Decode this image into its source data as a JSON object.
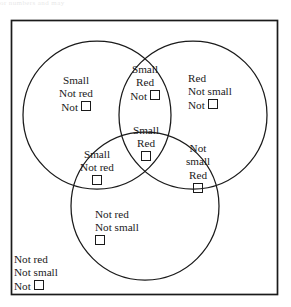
{
  "figure": {
    "type": "three-set Venn diagram",
    "top_sliver_text": "or numbers and may",
    "square_glyph": "open-square",
    "line_color": "#1a1a1a",
    "background_color": "#ffffff",
    "box": {
      "x": 11,
      "y": 20,
      "width": 267,
      "height": 275
    },
    "circles": [
      {
        "name": "small-circle",
        "label": "Small",
        "cx": 97,
        "cy": 115,
        "r": 74
      },
      {
        "name": "red-circle",
        "label": "Red",
        "cx": 193,
        "cy": 115,
        "r": 74
      },
      {
        "name": "square-circle",
        "label": "Square",
        "cx": 145,
        "cy": 206,
        "r": 74
      }
    ]
  },
  "regions": [
    {
      "id": "small-only",
      "name": "region-small-not-red-not-square",
      "sets": [
        "Small"
      ],
      "lines": [
        "Small",
        "Not red",
        "Not"
      ],
      "has_square": true,
      "square_on_line": 3
    },
    {
      "id": "small-red",
      "name": "region-small-red-not-square",
      "sets": [
        "Small",
        "Red"
      ],
      "lines": [
        "Small",
        "Red",
        "Not"
      ],
      "has_square": true,
      "square_on_line": 3
    },
    {
      "id": "red-only",
      "name": "region-red-not-small-not-square",
      "sets": [
        "Red"
      ],
      "lines": [
        "Red",
        "Not small",
        "Not"
      ],
      "has_square": true,
      "square_on_line": 3
    },
    {
      "id": "small-red-square",
      "name": "region-small-red-square",
      "sets": [
        "Small",
        "Red",
        "Square"
      ],
      "lines": [
        "Small",
        "Red",
        ""
      ],
      "has_square": true,
      "square_on_line": 3
    },
    {
      "id": "small-square",
      "name": "region-small-not-red-square",
      "sets": [
        "Small",
        "Square"
      ],
      "lines": [
        "Small",
        "Not red",
        ""
      ],
      "has_square": true,
      "square_on_line": 3
    },
    {
      "id": "red-square",
      "name": "region-not-small-red-square",
      "sets": [
        "Red",
        "Square"
      ],
      "lines": [
        "Not",
        "small",
        "Red",
        ""
      ],
      "has_square": true,
      "square_on_line": 4
    },
    {
      "id": "square-only",
      "name": "region-not-red-not-small-square",
      "sets": [
        "Square"
      ],
      "lines": [
        "Not red",
        "Not small",
        ""
      ],
      "has_square": true,
      "square_on_line": 3
    },
    {
      "id": "none",
      "name": "region-not-red-not-small-not-square",
      "sets": [],
      "lines": [
        "Not red",
        "Not small",
        "Not"
      ],
      "has_square": true,
      "square_on_line": 3
    }
  ],
  "labels": {
    "small_only": {
      "l1": "Small",
      "l2": "Not red",
      "l3": "Not"
    },
    "small_red": {
      "l1": "Small",
      "l2": "Red",
      "l3": "Not"
    },
    "red_only": {
      "l1": "Red",
      "l2": "Not small",
      "l3": "Not"
    },
    "small_red_square": {
      "l1": "Small",
      "l2": "Red"
    },
    "small_square": {
      "l1": "Small",
      "l2": "Not red"
    },
    "red_square": {
      "l1": "Not",
      "l2": "small",
      "l3": "Red"
    },
    "square_only": {
      "l1": "Not red",
      "l2": "Not small"
    },
    "none": {
      "l1": "Not red",
      "l2": "Not small",
      "l3": "Not"
    }
  }
}
